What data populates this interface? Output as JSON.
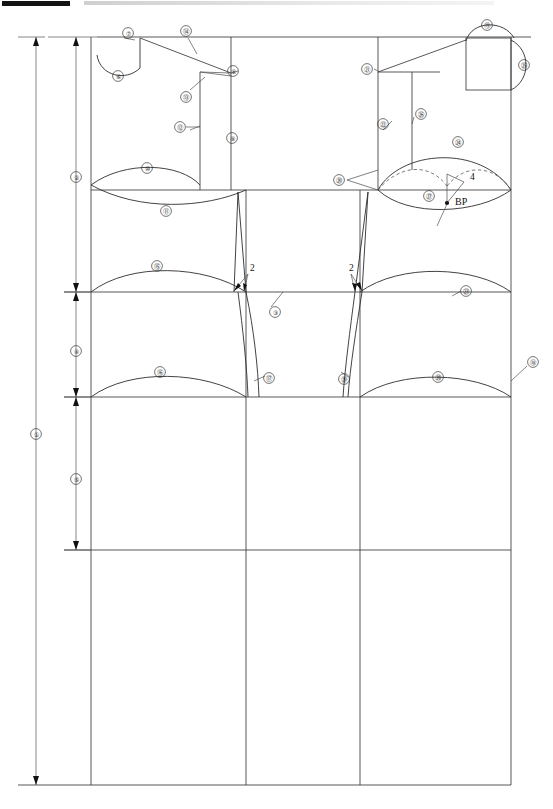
{
  "document": {
    "type": "technical-pattern-drafting-diagram",
    "subject": "bodice sloper / garment block draft",
    "page_width": 553,
    "page_height": 809,
    "background": "#ffffff",
    "line_color": "#3a3a3a"
  },
  "header": {
    "black_bar": "",
    "gray_bar": ""
  },
  "plain_labels": [
    {
      "id": "dart-left-amount",
      "text": "2",
      "x": 250,
      "y": 271
    },
    {
      "id": "dart-right-amount",
      "text": "2",
      "x": 349,
      "y": 271
    },
    {
      "id": "bust-dart-amount",
      "text": "4",
      "x": 470,
      "y": 180
    },
    {
      "id": "bust-point",
      "text": "BP",
      "x": 455,
      "y": 205
    }
  ],
  "callouts": [
    {
      "n": "1",
      "glyph": "①",
      "x": 36,
      "y": 434,
      "note": "total garment length (outermost dimension)"
    },
    {
      "n": "2",
      "glyph": "②",
      "x": 76,
      "y": 177,
      "note": "upper bodice depth dimension"
    },
    {
      "n": "3",
      "glyph": "③",
      "x": 275,
      "y": 312,
      "note": "waist dart / waist line callout"
    },
    {
      "n": "4",
      "glyph": "④",
      "x": 76,
      "y": 351,
      "note": "waist-to-hip dimension"
    },
    {
      "n": "5",
      "glyph": "⑤",
      "x": 76,
      "y": 479,
      "note": "hip-to-hem dimension"
    },
    {
      "n": "6",
      "glyph": "⑥",
      "x": 118,
      "y": 76,
      "note": "front neckline curve"
    },
    {
      "n": "7",
      "glyph": "⑦",
      "x": 128,
      "y": 33,
      "note": "shoulder neck point"
    },
    {
      "n": "8",
      "glyph": "⑧",
      "x": 233,
      "y": 71,
      "note": "shoulder tip / armhole point"
    },
    {
      "n": "9",
      "glyph": "⑨",
      "x": 232,
      "y": 138,
      "note": "center front / armhole depth line"
    },
    {
      "n": "10",
      "glyph": "⑩",
      "x": 147,
      "y": 168,
      "note": "upper lens curve (sleeve cap top)"
    },
    {
      "n": "11",
      "glyph": "⑪",
      "x": 166,
      "y": 211,
      "note": "lower lens curve (underarm)"
    },
    {
      "n": "12",
      "glyph": "⑫",
      "x": 180,
      "y": 127,
      "note": "shoulder seam offset line"
    },
    {
      "n": "13",
      "glyph": "⑬",
      "x": 186,
      "y": 97,
      "note": "shoulder slope leaders"
    },
    {
      "n": "14",
      "glyph": "⑭",
      "x": 186,
      "y": 31,
      "note": "shoulder line"
    },
    {
      "n": "15",
      "glyph": "⑮",
      "x": 157,
      "y": 266,
      "note": "waist curve (left panel)"
    },
    {
      "n": "16",
      "glyph": "⑯",
      "x": 160,
      "y": 372,
      "note": "hip curve (left panel)"
    },
    {
      "n": "17",
      "glyph": "⑰",
      "x": 269,
      "y": 378,
      "note": "left side seam"
    },
    {
      "n": "18",
      "glyph": "⑱",
      "x": 533,
      "y": 362,
      "note": "center back line"
    },
    {
      "n": "19",
      "glyph": "⑲",
      "x": 487,
      "y": 25,
      "note": "back neckline arc"
    },
    {
      "n": "20",
      "glyph": "⑳",
      "x": 339,
      "y": 180,
      "note": "back armhole notch leaders"
    },
    {
      "n": "21",
      "glyph": "㉑",
      "x": 367,
      "y": 69,
      "note": "back shoulder point"
    },
    {
      "n": "22",
      "glyph": "㉒",
      "x": 383,
      "y": 124,
      "note": "back armhole depth line"
    },
    {
      "n": "23",
      "glyph": "㉓",
      "x": 466,
      "y": 291,
      "note": "back waist shaping"
    },
    {
      "n": "24",
      "glyph": "㉔",
      "x": 458,
      "y": 142,
      "note": "back sleeve-cap curve"
    },
    {
      "n": "25",
      "glyph": "㉕",
      "x": 524,
      "y": 65,
      "note": "back neck width arc"
    },
    {
      "n": "26",
      "glyph": "㉖",
      "x": 421,
      "y": 114,
      "note": "back shoulder drop line"
    },
    {
      "n": "27",
      "glyph": "㉗",
      "x": 429,
      "y": 196,
      "note": "bust point leader"
    },
    {
      "n": "28",
      "glyph": "㉘",
      "x": 438,
      "y": 377,
      "note": "back hip curve"
    },
    {
      "n": "29",
      "glyph": "㉙",
      "x": 344,
      "y": 379,
      "note": "back side seam"
    }
  ]
}
